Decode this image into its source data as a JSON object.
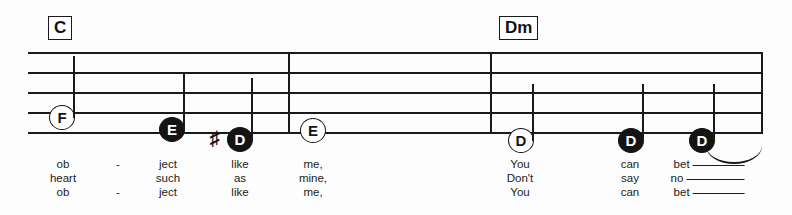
{
  "sheet": {
    "width": 792,
    "height": 215,
    "background": "#fdfdfd",
    "ink": "#1a1a1a"
  },
  "chords": [
    {
      "label": "C",
      "x": 48,
      "y": 16
    },
    {
      "label": "Dm",
      "x": 499,
      "y": 16
    }
  ],
  "staff": {
    "left": 28,
    "top": 52,
    "width": 735,
    "height": 81,
    "line_count": 5,
    "line_spacing": 20,
    "barlines": [
      {
        "name": "barline-1",
        "x": 260
      },
      {
        "name": "barline-2",
        "x": 462
      }
    ],
    "end_barline": true
  },
  "notes": [
    {
      "name": "note-f",
      "pitch": "F",
      "head": "hollow",
      "x": 62,
      "y": 118,
      "stem": "up",
      "stem_height": 62,
      "accidental": ""
    },
    {
      "name": "note-e-1",
      "pitch": "E",
      "head": "filled",
      "x": 172,
      "y": 130,
      "stem": "up",
      "stem_height": 58,
      "accidental": ""
    },
    {
      "name": "note-d-sharp",
      "pitch": "D",
      "head": "filled",
      "x": 240,
      "y": 140,
      "stem": "up",
      "stem_height": 62,
      "accidental": "♯"
    },
    {
      "name": "note-e-2",
      "pitch": "E",
      "head": "hollow",
      "x": 313,
      "y": 131,
      "stem": "none",
      "stem_height": 0,
      "accidental": ""
    },
    {
      "name": "note-d-1",
      "pitch": "D",
      "head": "hollow",
      "x": 521,
      "y": 141,
      "stem": "up",
      "stem_height": 57,
      "accidental": ""
    },
    {
      "name": "note-d-2",
      "pitch": "D",
      "head": "filled",
      "x": 631,
      "y": 141,
      "stem": "up",
      "stem_height": 57,
      "accidental": ""
    },
    {
      "name": "note-d-3",
      "pitch": "D",
      "head": "filled",
      "x": 702,
      "y": 141,
      "stem": "up",
      "stem_height": 57,
      "accidental": ""
    }
  ],
  "slur": {
    "name": "slur-final",
    "x": 706,
    "y": 146,
    "width": 56
  },
  "lyrics": {
    "rows": [
      {
        "verse": 1,
        "cells": [
          {
            "text": "ob",
            "x": 63,
            "melisma": false,
            "line_width": 0
          },
          {
            "text": "-",
            "x": 118,
            "melisma": false,
            "line_width": 0
          },
          {
            "text": "ject",
            "x": 168,
            "melisma": false,
            "line_width": 0
          },
          {
            "text": "like",
            "x": 240,
            "melisma": false,
            "line_width": 0
          },
          {
            "text": "me,",
            "x": 313,
            "melisma": false,
            "line_width": 0
          },
          {
            "text": "You",
            "x": 520,
            "melisma": false,
            "line_width": 0
          },
          {
            "text": "can",
            "x": 630,
            "melisma": false,
            "line_width": 0
          },
          {
            "text": "bet",
            "x": 702,
            "melisma": true,
            "line_width": 52
          }
        ]
      },
      {
        "verse": 2,
        "cells": [
          {
            "text": "heart",
            "x": 63,
            "melisma": false,
            "line_width": 0
          },
          {
            "text": "such",
            "x": 168,
            "melisma": false,
            "line_width": 0
          },
          {
            "text": "as",
            "x": 240,
            "melisma": false,
            "line_width": 0
          },
          {
            "text": "mine,",
            "x": 313,
            "melisma": false,
            "line_width": 0
          },
          {
            "text": "Don't",
            "x": 520,
            "melisma": false,
            "line_width": 0
          },
          {
            "text": "say",
            "x": 630,
            "melisma": false,
            "line_width": 0
          },
          {
            "text": "no",
            "x": 700,
            "melisma": true,
            "line_width": 58
          }
        ]
      },
      {
        "verse": 3,
        "cells": [
          {
            "text": "ob",
            "x": 63,
            "melisma": false,
            "line_width": 0
          },
          {
            "text": "-",
            "x": 118,
            "melisma": false,
            "line_width": 0
          },
          {
            "text": "ject",
            "x": 168,
            "melisma": false,
            "line_width": 0
          },
          {
            "text": "like",
            "x": 240,
            "melisma": false,
            "line_width": 0
          },
          {
            "text": "me,",
            "x": 313,
            "melisma": false,
            "line_width": 0
          },
          {
            "text": "You",
            "x": 520,
            "melisma": false,
            "line_width": 0
          },
          {
            "text": "can",
            "x": 630,
            "melisma": false,
            "line_width": 0
          },
          {
            "text": "bet",
            "x": 702,
            "melisma": true,
            "line_width": 52
          }
        ]
      }
    ]
  }
}
